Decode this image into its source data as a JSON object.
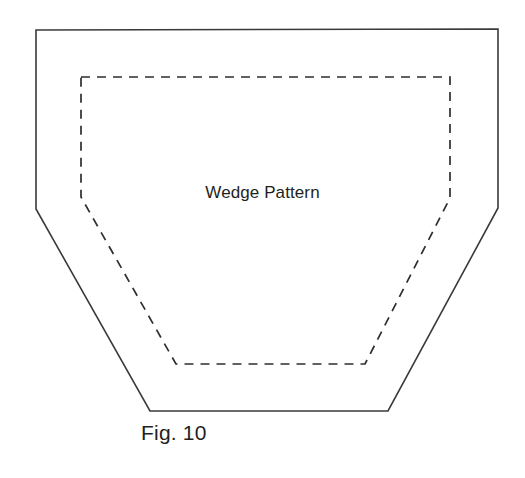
{
  "figure": {
    "caption": "Fig. 10",
    "label": "Wedge Pattern",
    "canvas": {
      "width": 525,
      "height": 478,
      "background": "#ffffff"
    },
    "outer_outline": {
      "name": "wedge-outer-cut-line",
      "style": "solid",
      "stroke_color": "#3a3a3c",
      "stroke_width": 1.6,
      "points": "36,30 498,29 498,208 388,411 150,411 36,209"
    },
    "inner_outline": {
      "name": "wedge-inner-seam-line",
      "style": "dashed",
      "stroke_color": "#2e2e30",
      "stroke_width": 1.7,
      "dash_pattern": "9 7",
      "points": "81,77 450,77 450,198 365,364 176,364 81,197"
    }
  },
  "chart_data": {
    "type": "diagram",
    "title": "Fig. 10",
    "annotations": [
      "Wedge Pattern"
    ],
    "shapes": [
      {
        "name": "outer cut outline",
        "line": "solid",
        "vertices": [
          [
            36,
            30
          ],
          [
            498,
            29
          ],
          [
            498,
            208
          ],
          [
            388,
            411
          ],
          [
            150,
            411
          ],
          [
            36,
            209
          ]
        ]
      },
      {
        "name": "inner stitch/seam outline",
        "line": "dashed",
        "vertices": [
          [
            81,
            77
          ],
          [
            450,
            77
          ],
          [
            450,
            198
          ],
          [
            365,
            364
          ],
          [
            176,
            364
          ],
          [
            81,
            197
          ]
        ]
      }
    ]
  }
}
